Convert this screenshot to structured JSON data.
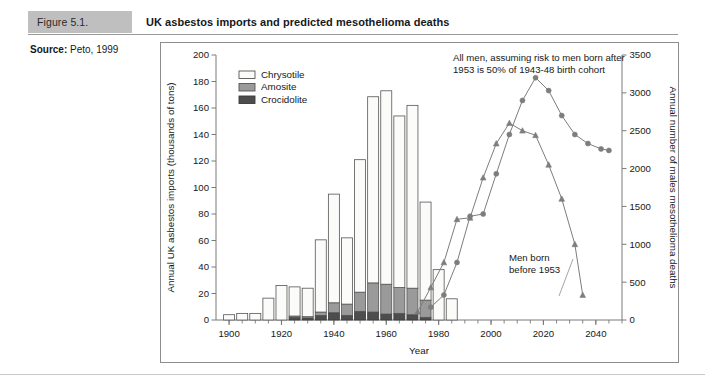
{
  "header": {
    "figure_number": "Figure 5.1.",
    "title": "UK asbestos imports and predicted mesothelioma deaths"
  },
  "source": {
    "label": "Source:",
    "value": " Peto, 1999"
  },
  "chart_data": {
    "type": "bar",
    "title": "UK asbestos imports and predicted mesothelioma deaths",
    "xlabel": "Year",
    "ylabel": "Annual UK asbestos imports (thousands of tons)",
    "y2label": "Annual number of males mesothelioma deaths",
    "xlim": [
      1895,
      2050
    ],
    "ylim": [
      0,
      200
    ],
    "y2lim": [
      0,
      3500
    ],
    "xticks": [
      1900,
      1920,
      1940,
      1960,
      1980,
      2000,
      2020,
      2040
    ],
    "xticklabels": [
      "1900",
      "1920",
      "1940",
      "1960",
      "1980",
      "2000",
      "2020",
      "2040"
    ],
    "xminor_step": 5,
    "yticks": [
      0,
      20,
      40,
      60,
      80,
      100,
      120,
      140,
      160,
      180,
      200
    ],
    "yticklabels": [
      "0",
      "20",
      "40",
      "60",
      "80",
      "100",
      "120",
      "140",
      "160",
      "180",
      "200"
    ],
    "y2ticks": [
      0,
      500,
      1000,
      1500,
      2000,
      2500,
      3000,
      3500
    ],
    "y2ticklabels": [
      "0",
      "500",
      "1000",
      "1500",
      "2000",
      "2500",
      "3000",
      "3500"
    ],
    "grid": false,
    "legend_position": "upper-left",
    "bar_width_years": 4.2,
    "legend": [
      {
        "name": "Chrysotile",
        "fill": "#fbfbfa",
        "stroke": "#555555"
      },
      {
        "name": "Amosite",
        "fill": "#9a9a9a",
        "stroke": "#555555"
      },
      {
        "name": "Crocidolite",
        "fill": "#4d4d4d",
        "stroke": "#3a3a3a"
      }
    ],
    "bar_categories": [
      1900,
      1905,
      1910,
      1915,
      1920,
      1925,
      1930,
      1935,
      1940,
      1945,
      1950,
      1955,
      1960,
      1965,
      1970,
      1975,
      1980,
      1985,
      1990
    ],
    "bar_series": [
      {
        "name": "Crocidolite",
        "values": [
          0,
          0,
          0,
          0,
          0,
          2.0,
          1.5,
          3.5,
          5.5,
          3.5,
          6.5,
          6.0,
          4.5,
          5.0,
          4.0,
          2.0,
          0,
          0,
          0
        ]
      },
      {
        "name": "Amosite",
        "values": [
          0,
          0,
          0,
          0,
          0,
          1.0,
          1.0,
          2.5,
          7.5,
          8.5,
          14.5,
          22.0,
          22.5,
          19.5,
          20.0,
          13.0,
          0,
          0,
          0
        ]
      },
      {
        "name": "Chrysotile",
        "values": [
          4.0,
          5.0,
          5.0,
          16.5,
          26.0,
          22.0,
          21.5,
          54.5,
          82.0,
          50.0,
          100.0,
          140.5,
          146.0,
          129.5,
          138.0,
          74.0,
          38.0,
          16.0,
          0
        ]
      }
    ],
    "bar_totals": [
      4,
      5,
      5,
      16.5,
      26,
      25,
      24,
      60.5,
      95,
      62,
      121,
      168.5,
      173,
      154,
      162,
      89,
      38,
      16,
      0
    ],
    "line_series": [
      {
        "name": "All men, assuming risk to men born after 1953 is 50% of 1943-48 birth cohort",
        "marker": "circle",
        "color": "#7d7d7d",
        "axis": "right",
        "x": [
          1977,
          1982,
          1987,
          1992,
          1997,
          2002,
          2007,
          2012,
          2017,
          2022,
          2027,
          2032,
          2037,
          2042,
          2045
        ],
        "y": [
          170,
          330,
          760,
          1370,
          1400,
          1930,
          2450,
          2900,
          3200,
          3030,
          2700,
          2450,
          2330,
          2260,
          2240
        ]
      },
      {
        "name": "Men born before 1953",
        "marker": "triangle",
        "color": "#7d7d7d",
        "axis": "right",
        "x": [
          1972,
          1977,
          1982,
          1987,
          1992,
          1997,
          2002,
          2007,
          2012,
          2017,
          2022,
          2027,
          2032,
          2035
        ],
        "y": [
          110,
          430,
          760,
          1330,
          1350,
          1880,
          2330,
          2600,
          2500,
          2440,
          2050,
          1600,
          1000,
          330
        ]
      }
    ],
    "annotations": [
      {
        "name": "all-men-annotation",
        "text_line1": "All men, assuming risk to men born after",
        "text_line2": "1953 is 50% of 1943-48 birth cohort"
      },
      {
        "name": "men-born-before-annotation",
        "text_line1": "Men born",
        "text_line2": "before 1953"
      }
    ]
  }
}
